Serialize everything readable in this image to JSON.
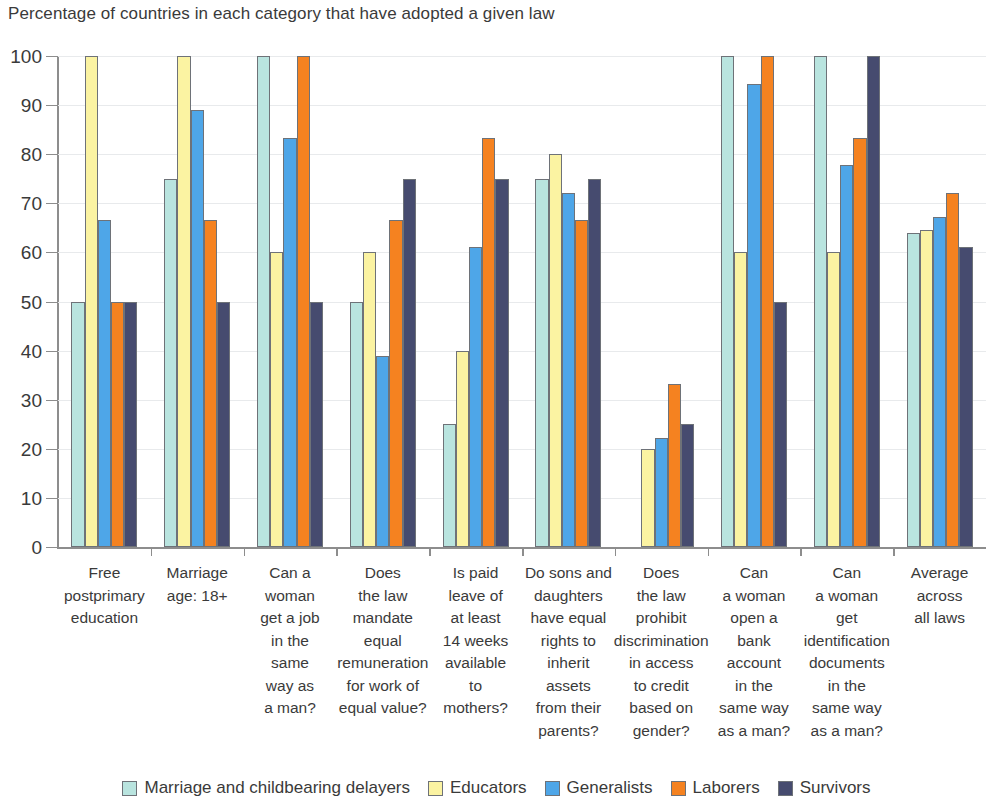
{
  "chart_data": {
    "type": "bar",
    "title": "Percentage of countries in each category that have adopted a given law",
    "xlabel": "",
    "ylabel": "",
    "ylim": [
      0,
      100
    ],
    "yticks": [
      0,
      10,
      20,
      30,
      40,
      50,
      60,
      70,
      80,
      90,
      100
    ],
    "grid": true,
    "legend_position": "bottom",
    "categories": [
      "Free postprimary education",
      "Marriage age: 18+",
      "Can a woman get a job in the same way as a man?",
      "Does the law mandate equal remuneration for work of equal value?",
      "Is paid leave of at least 14 weeks available to mothers?",
      "Do sons and daughters have equal rights to inherit assets from their parents?",
      "Does the law prohibit discrimination in access to credit based on gender?",
      "Can a woman open a bank account in the same way as a man?",
      "Can a woman get identification documents in the same way as a man?",
      "Average across all laws"
    ],
    "category_lines": [
      [
        "Free",
        "postprimary",
        "education"
      ],
      [
        "Marriage",
        "age: 18+"
      ],
      [
        "Can a",
        "woman",
        "get a job",
        "in the",
        "same",
        "way as",
        "a man?"
      ],
      [
        "Does",
        "the law",
        "mandate",
        "equal",
        "remuneration",
        "for work of",
        "equal value?"
      ],
      [
        "Is paid",
        "leave of",
        "at least",
        "14 weeks",
        "available",
        "to",
        "mothers?"
      ],
      [
        "Do sons and",
        "daughters",
        "have equal",
        "rights to",
        "inherit",
        "assets",
        "from their",
        "parents?"
      ],
      [
        "Does",
        "the law",
        "prohibit",
        "discrimination",
        "in access",
        "to credit",
        "based on",
        "gender?"
      ],
      [
        "Can",
        "a woman",
        "open a",
        "bank",
        "account",
        "in the",
        "same way",
        "as a man?"
      ],
      [
        "Can",
        "a woman",
        "get",
        "identification",
        "documents",
        "in the",
        "same way",
        "as a man?"
      ],
      [
        "Average",
        "across",
        "all laws"
      ]
    ],
    "series": [
      {
        "name": "Marriage and childbearing delayers",
        "color": "#b9e4df",
        "values": [
          50,
          75,
          100,
          50,
          25,
          75,
          0,
          100,
          100,
          64
        ]
      },
      {
        "name": "Educators",
        "color": "#fbf3a2",
        "values": [
          100,
          100,
          60,
          60,
          40,
          80,
          20,
          60,
          60,
          64.5
        ]
      },
      {
        "name": "Generalists",
        "color": "#4ea6e8",
        "values": [
          66.7,
          89,
          83.3,
          39,
          61.1,
          72.2,
          22.2,
          94.4,
          77.8,
          67.2
        ]
      },
      {
        "name": "Laborers",
        "color": "#f58220",
        "values": [
          50,
          66.7,
          100,
          66.7,
          83.3,
          66.7,
          33.3,
          100,
          83.3,
          72.2
        ]
      },
      {
        "name": "Survivors",
        "color": "#464b6f",
        "values": [
          50,
          50,
          50,
          75,
          75,
          75,
          25,
          50,
          100,
          61.1
        ]
      }
    ]
  },
  "legend": {
    "items": [
      {
        "label": "Marriage and childbearing delayers",
        "color": "#b9e4df"
      },
      {
        "label": "Educators",
        "color": "#fbf3a2"
      },
      {
        "label": "Generalists",
        "color": "#4ea6e8"
      },
      {
        "label": "Laborers",
        "color": "#f58220"
      },
      {
        "label": "Survivors",
        "color": "#464b6f"
      }
    ]
  }
}
